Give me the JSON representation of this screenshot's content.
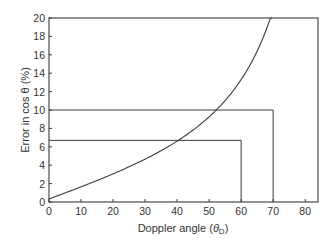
{
  "chart_data": {
    "type": "line",
    "title": "",
    "xlabel": "Doppler angle (θD)",
    "ylabel": "Error in cos θ (%)",
    "xlim": [
      0,
      84
    ],
    "ylim": [
      0,
      20
    ],
    "x_ticks": [
      0,
      10,
      20,
      30,
      40,
      50,
      60,
      70,
      80
    ],
    "y_ticks": [
      0,
      2,
      4,
      6,
      8,
      10,
      12,
      14,
      16,
      18,
      20
    ],
    "grid": false,
    "legend": null,
    "series": [
      {
        "name": "Error in cos θ for 5° angle error",
        "x": [
          0,
          10,
          20,
          30,
          40,
          50,
          60,
          65,
          70,
          75,
          78,
          80,
          81
        ],
        "y": [
          0,
          0.9,
          1.8,
          2.9,
          4.2,
          5.4,
          6.7,
          8.2,
          10.0,
          12.8,
          15.5,
          18.4,
          20
        ]
      }
    ],
    "annotations": [
      {
        "type": "guide",
        "x": 60,
        "y": 6.7
      },
      {
        "type": "guide",
        "x": 70,
        "y": 10
      }
    ]
  },
  "labels": {
    "xlabel_main": "Doppler angle (",
    "xlabel_theta": "θ",
    "xlabel_sub": "D",
    "xlabel_close": ")",
    "ylabel": "Error in cos θ (%)"
  }
}
